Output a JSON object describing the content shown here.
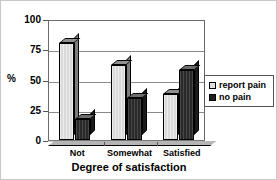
{
  "chart_data": {
    "type": "bar",
    "title": "",
    "xlabel": "Degree of satisfaction",
    "ylabel": "%",
    "categories": [
      "Not",
      "Somewhat",
      "Satisfied"
    ],
    "series": [
      {
        "name": "report pain",
        "values": [
          80,
          62,
          38
        ],
        "color": "#d9d9d9"
      },
      {
        "name": "no pain",
        "values": [
          17,
          35,
          58
        ],
        "color": "#2a2a2a"
      }
    ],
    "ylim": [
      0,
      100
    ],
    "yticks": [
      0,
      25,
      50,
      75,
      100
    ],
    "yticklabels": [
      "0",
      "25",
      "50",
      "75",
      "100"
    ],
    "grid": true,
    "grid_axis": "y",
    "legend_position": "right",
    "style": "3d-bar"
  },
  "legend": {
    "entries": [
      {
        "label": "report pain",
        "swatch": "light"
      },
      {
        "label": "no pain",
        "swatch": "dark"
      }
    ]
  },
  "axes": {
    "y_label": "%",
    "x_title": "Degree of satisfaction"
  }
}
